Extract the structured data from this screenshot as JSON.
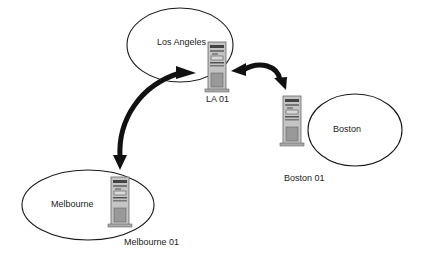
{
  "diagram": {
    "type": "network-topology",
    "sites": [
      {
        "id": "la",
        "name": "Los Angeles",
        "server": "LA 01"
      },
      {
        "id": "boston",
        "name": "Boston",
        "server": "Boston 01"
      },
      {
        "id": "melbourne",
        "name": "Melbourne",
        "server": "Melbourne 01"
      }
    ],
    "links": [
      {
        "from": "LA 01",
        "to": "Boston 01",
        "direction": "bidirectional"
      },
      {
        "from": "LA 01",
        "to": "Melbourne 01",
        "direction": "bidirectional"
      }
    ],
    "colors": {
      "background": "#ffffff",
      "line": "#1a1a1a",
      "server_body": "#b8b8b8",
      "server_dark": "#555555"
    }
  }
}
